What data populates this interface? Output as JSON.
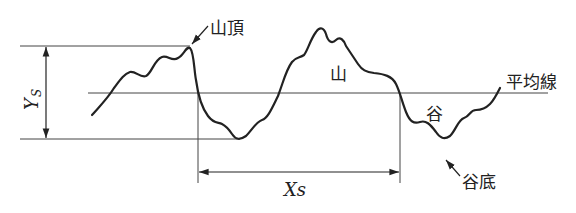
{
  "diagram": {
    "type": "surface-profile",
    "labels": {
      "peak_top": "山頂",
      "mountain": "山",
      "valley": "谷",
      "valley_bottom": "谷底",
      "mean_line": "平均線",
      "ys_main": "Y",
      "ys_sub": "S",
      "xs": "Xs"
    },
    "colors": {
      "line": "#222222",
      "thin": "#444444",
      "background": "#ffffff"
    }
  }
}
